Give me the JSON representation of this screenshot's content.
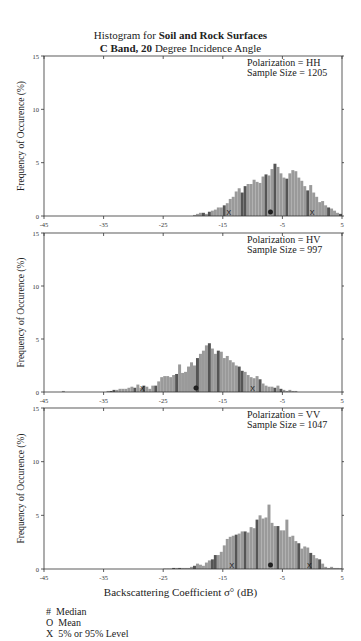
{
  "title": {
    "line1_prefix": "Histogram for ",
    "line1_bold": "Soil and Rock Surfaces",
    "line2_bold": "C Band, 20",
    "line2_rest": " Degree Incidence Angle"
  },
  "xlabel": "Backscattering Coefficient σ° (dB)",
  "ylabel": "Frequency of Occurence (%)",
  "legend": [
    {
      "symbol": "#",
      "label": "Median"
    },
    {
      "symbol": "O",
      "label": "Mean"
    },
    {
      "symbol": "X",
      "label": "5% or 95% Level"
    }
  ],
  "colors": {
    "bar_fill": "#9a9a9a",
    "bar_dark": "#555555",
    "axis": "#333333"
  },
  "chart_data": [
    {
      "type": "bar",
      "title": "Polarization = HH",
      "annotation": [
        "Polarization = HH",
        "Sample Size =  1205"
      ],
      "polarization": "HH",
      "sample_size": 1205,
      "xlabel": "Backscattering Coefficient σ° (dB)",
      "ylabel": "Frequency of Occurence (%)",
      "xlim": [
        -45,
        5
      ],
      "ylim": [
        0,
        15
      ],
      "xticks": [
        -45,
        -35,
        -25,
        -15,
        -5,
        5
      ],
      "yticks": [
        0,
        5,
        10,
        15
      ],
      "bin_width_db": 0.5,
      "bin_start": -20,
      "values": [
        0.1,
        0.2,
        0.3,
        0.3,
        0.2,
        0.4,
        0.5,
        0.6,
        0.8,
        0.8,
        1.0,
        1.2,
        1.6,
        1.8,
        2.3,
        2.6,
        2.2,
        2.8,
        3.0,
        3.0,
        3.4,
        3.2,
        3.1,
        3.7,
        3.9,
        3.8,
        4.4,
        4.9,
        4.6,
        4.0,
        3.6,
        3.5,
        4.0,
        4.3,
        4.2,
        3.6,
        3.3,
        2.8,
        2.4,
        2.9,
        2.2,
        1.8,
        1.3,
        1.4,
        1.0,
        0.8,
        0.7,
        0.5,
        0.3,
        0.2
      ],
      "markers": {
        "p5": -14,
        "mean": -7,
        "median": -7,
        "p95": 0
      }
    },
    {
      "type": "bar",
      "title": "Polarization = HV",
      "annotation": [
        "Polarization = HV",
        "Sample Size =   997"
      ],
      "polarization": "HV",
      "sample_size": 997,
      "xlabel": "Backscattering Coefficient σ° (dB)",
      "ylabel": "Frequency of Occurence (%)",
      "xlim": [
        -45,
        5
      ],
      "ylim": [
        0,
        15
      ],
      "xticks": [
        -45,
        -35,
        -25,
        -15,
        -5,
        5
      ],
      "yticks": [
        0,
        5,
        10,
        15
      ],
      "bin_width_db": 0.5,
      "bin_start": -42,
      "values": [
        0.1,
        0,
        0,
        0,
        0,
        0,
        0,
        0,
        0,
        0,
        0,
        0,
        0,
        0,
        0,
        0.1,
        0.1,
        0.2,
        0.2,
        0.3,
        0.3,
        0.3,
        0.4,
        0.5,
        0.4,
        0.7,
        0.4,
        0.6,
        0.5,
        0.3,
        0.6,
        0.6,
        1.0,
        1.4,
        1.5,
        1.5,
        1.4,
        1.6,
        1.7,
        2.6,
        1.8,
        1.9,
        2.4,
        2.8,
        2.5,
        3.2,
        3.6,
        3.9,
        4.4,
        4.6,
        4.1,
        3.6,
        3.9,
        3.8,
        3.2,
        3.4,
        3.0,
        2.8,
        2.5,
        2.4,
        2.0,
        1.9,
        1.6,
        1.4,
        1.3,
        1.5,
        1.2,
        0.8,
        0.6,
        0.5,
        0.5,
        0.4,
        0.6,
        0.3,
        0.2,
        0.1,
        0.2,
        0.1,
        0.1
      ],
      "markers": {
        "p5": -28.5,
        "mean": -19.5,
        "median": -19.5,
        "p95": -10
      }
    },
    {
      "type": "bar",
      "title": "Polarization = VV",
      "annotation": [
        "Polarization = VV",
        "Sample Size =  1047"
      ],
      "polarization": "VV",
      "sample_size": 1047,
      "xlabel": "Backscattering Coefficient σ° (dB)",
      "ylabel": "Frequency of Occurence (%)",
      "xlim": [
        -45,
        5
      ],
      "ylim": [
        0,
        15
      ],
      "xticks": [
        -45,
        -35,
        -25,
        -15,
        -5,
        5
      ],
      "yticks": [
        0,
        5,
        10,
        15
      ],
      "bin_width_db": 0.5,
      "bin_start": -25,
      "values": [
        0.05,
        0.05,
        0.05,
        0.1,
        0.1,
        0.1,
        0.1,
        0.1,
        0.1,
        0.2,
        0.3,
        0.5,
        0.4,
        0.3,
        0.6,
        0.8,
        0.9,
        1.3,
        1.3,
        1.6,
        2.2,
        2.8,
        3.0,
        3.1,
        3.2,
        3.3,
        3.5,
        3.5,
        3.4,
        3.9,
        3.8,
        4.6,
        5.0,
        4.7,
        4.8,
        6.0,
        4.3,
        4.0,
        4.0,
        3.6,
        3.6,
        4.6,
        3.0,
        3.1,
        2.6,
        2.4,
        1.9,
        2.1,
        2.0,
        1.5,
        1.3,
        1.0,
        0.9,
        0.5,
        0.2,
        0.1,
        0.2,
        0.1,
        0.1,
        0.05
      ],
      "markers": {
        "p5": -13.5,
        "mean": -7,
        "median": -7,
        "p95": -0.5
      }
    }
  ]
}
